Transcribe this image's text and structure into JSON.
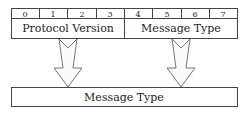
{
  "diagram": {
    "bits": [
      "0",
      "1",
      "2",
      "3",
      "4",
      "5",
      "6",
      "7"
    ],
    "top_fields": [
      {
        "label": "Protocol Version"
      },
      {
        "label": "Message Type"
      }
    ],
    "bottom_field": {
      "label": "Message Type"
    },
    "colors": {
      "stroke": "#444444",
      "arrow_fill": "#ffffff"
    }
  }
}
